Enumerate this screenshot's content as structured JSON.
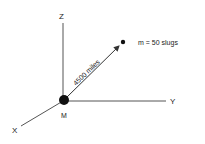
{
  "diagram": {
    "axes": {
      "x_label": "X",
      "y_label": "Y",
      "z_label": "Z"
    },
    "origin_mass_label": "M",
    "small_mass_label": "m = 50 slugs",
    "distance_label": "4500 miles",
    "colors": {
      "line": "#444444",
      "mass": "#111111",
      "background": "#ffffff"
    }
  }
}
